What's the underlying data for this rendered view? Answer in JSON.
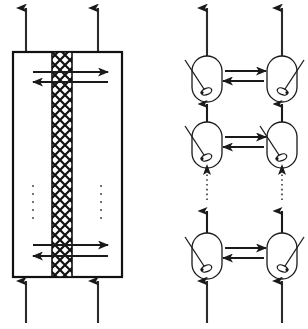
{
  "figure": {
    "background_color": "#ffffff",
    "line_color": "#1a1a1a",
    "membrane_color": "#111111",
    "width": 308,
    "height": 329
  },
  "left_panel": {
    "name": "membrane-reactor-vessel",
    "vessel": {
      "x": 13,
      "y": 52,
      "width": 109,
      "height": 225,
      "stroke_width": 2.2,
      "fill": "#ffffff",
      "stroke": "#111111"
    },
    "membrane": {
      "name": "cross-hatched-membrane",
      "x": 52,
      "y": 52,
      "width": 20,
      "height": 225,
      "pattern": "cross-hatch",
      "stroke": "#111111"
    },
    "outlet_arrows": [
      {
        "name": "outlet-arrow-left",
        "x": 26,
        "y_start": 52,
        "y_end": 6
      },
      {
        "name": "outlet-arrow-right",
        "x": 98,
        "y_start": 52,
        "y_end": 6
      }
    ],
    "inlet_arrows": [
      {
        "name": "inlet-arrow-left",
        "x": 26,
        "y_start": 323,
        "y_end": 279
      },
      {
        "name": "inlet-arrow-right",
        "x": 98,
        "y_start": 323,
        "y_end": 279
      }
    ],
    "transfer_arrow_groups": [
      {
        "name": "transfer-arrows-top",
        "forward": {
          "direction": "right",
          "x_start": 33,
          "x_end": 108,
          "y": 72
        },
        "backward": {
          "direction": "left",
          "x_start": 108,
          "x_end": 33,
          "y": 82
        }
      },
      {
        "name": "transfer-arrows-bottom",
        "forward": {
          "direction": "right",
          "x_start": 33,
          "x_end": 108,
          "y": 245
        },
        "backward": {
          "direction": "left",
          "x_start": 108,
          "x_end": 33,
          "y": 256
        }
      }
    ],
    "ellipses": [
      {
        "name": "vertical-ellipsis-left",
        "x": 33,
        "y_start": 186,
        "count": 5,
        "spacing": 8
      },
      {
        "name": "vertical-ellipsis-right",
        "x": 101,
        "y_start": 186,
        "count": 5,
        "spacing": 8
      }
    ]
  },
  "right_panel": {
    "name": "discretized-cell-network",
    "columns": [
      {
        "name": "column-retentate",
        "x": 207
      },
      {
        "name": "column-permeate",
        "x": 282
      }
    ],
    "cell_geometry": {
      "width": 30,
      "height": 46,
      "corner_radius": 15
    },
    "rows": [
      {
        "name": "cell-row-top",
        "y": 56,
        "cells": [
          {
            "name": "cell-top-left",
            "x": 207,
            "stirrer_side": "left",
            "label": "stirred-tank-cell"
          },
          {
            "name": "cell-top-right",
            "x": 282,
            "stirrer_side": "right",
            "label": "stirred-tank-cell"
          }
        ],
        "exchange_arrows": {
          "name": "exchange-arrows-top",
          "forward": {
            "direction": "right",
            "x_start": 225,
            "x_end": 265,
            "y": 71
          },
          "backward": {
            "direction": "left",
            "x_start": 265,
            "x_end": 225,
            "y": 81
          }
        }
      },
      {
        "name": "cell-row-middle",
        "y": 122,
        "cells": [
          {
            "name": "cell-middle-left",
            "x": 207,
            "stirrer_side": "left",
            "label": "stirred-tank-cell"
          },
          {
            "name": "cell-middle-right",
            "x": 282,
            "stirrer_side": "left",
            "label": "stirred-tank-cell"
          }
        ],
        "exchange_arrows": {
          "name": "exchange-arrows-middle",
          "forward": {
            "direction": "right",
            "x_start": 225,
            "x_end": 265,
            "y": 137
          },
          "backward": {
            "direction": "left",
            "x_start": 265,
            "x_end": 225,
            "y": 147
          }
        }
      },
      {
        "name": "cell-row-bottom",
        "y": 233,
        "cells": [
          {
            "name": "cell-bottom-left",
            "x": 207,
            "stirrer_side": "left",
            "label": "stirred-tank-cell"
          },
          {
            "name": "cell-bottom-right",
            "x": 282,
            "stirrer_side": "right",
            "label": "stirred-tank-cell"
          }
        ],
        "exchange_arrows": {
          "name": "exchange-arrows-bottom",
          "forward": {
            "direction": "right",
            "x_start": 225,
            "x_end": 265,
            "y": 248
          },
          "backward": {
            "direction": "left",
            "x_start": 265,
            "x_end": 225,
            "y": 258
          }
        }
      }
    ],
    "outlet_arrows": [
      {
        "name": "cell-outlet-arrow-left",
        "x": 207,
        "y_start": 56,
        "y_end": 6
      },
      {
        "name": "cell-outlet-arrow-right",
        "x": 282,
        "y_start": 56,
        "y_end": 6
      }
    ],
    "inlet_arrows": [
      {
        "name": "cell-inlet-arrow-left",
        "x": 207,
        "y_start": 323,
        "y_end": 279
      },
      {
        "name": "cell-inlet-arrow-right",
        "x": 282,
        "y_start": 323,
        "y_end": 279
      }
    ],
    "connector_arrows": [
      {
        "name": "connector-top-left",
        "x": 207,
        "y_start": 122,
        "y_end": 102
      },
      {
        "name": "connector-top-right",
        "x": 282,
        "y_start": 122,
        "y_end": 102
      },
      {
        "name": "connector-bottom-left",
        "x": 207,
        "y_start": 233,
        "y_end": 213
      },
      {
        "name": "connector-bottom-right",
        "x": 282,
        "y_start": 233,
        "y_end": 213
      }
    ],
    "dotted_connectors": [
      {
        "name": "dotted-connector-left",
        "x": 207,
        "y_start": 168,
        "y_end": 200
      },
      {
        "name": "dotted-connector-right",
        "x": 282,
        "y_start": 168,
        "y_end": 200
      }
    ],
    "dotted_arrow_heads": [
      {
        "name": "dotted-arrow-head-left",
        "x": 207,
        "y": 166
      },
      {
        "name": "dotted-arrow-head-right",
        "x": 282,
        "y": 166
      }
    ]
  }
}
